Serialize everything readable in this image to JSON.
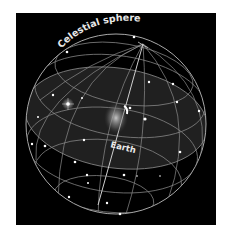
{
  "figure": {
    "title": "Celestial sphere",
    "labels": {
      "sphere": "Celestial sphere",
      "center": "Earth"
    },
    "colors": {
      "background": "#000000",
      "page": "#ffffff",
      "grid_lines": "#9a9a9a",
      "stars": "#ffffff",
      "equatorial_plane": "#2a2a2a"
    }
  }
}
